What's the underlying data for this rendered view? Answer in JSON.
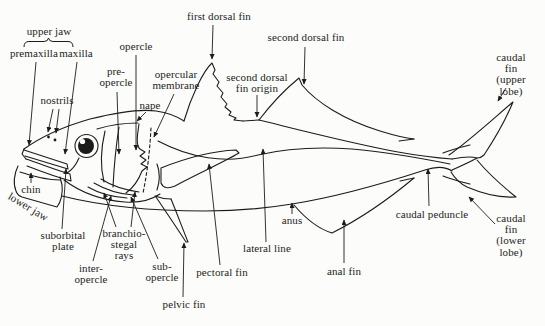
{
  "figure": {
    "type": "fish-anatomy-diagram",
    "ink_color": "#1c1c1c",
    "paper_color": "#fcfcfa",
    "labels": {
      "upper_jaw": "upper jaw",
      "premaxilla": "premaxilla",
      "maxilla": "maxilla",
      "nostrils": "nostrils",
      "opercle": "opercle",
      "pre_opercle": "pre-\nopercle",
      "opercular_membrane": "opercular\nmembrane",
      "nape": "nape",
      "first_dorsal_fin": "first dorsal fin",
      "second_dorsal_fin": "second dorsal fin",
      "second_dorsal_fin_origin": "second dorsal\nfin origin",
      "caudal_fin_upper": "caudal fin\n(upper lobe)",
      "chin": "chin",
      "lower_jaw": "lower jaw",
      "suborbital_plate": "suborbital\nplate",
      "branchiostegal_rays": "branchio-\nstegal\nrays",
      "inter_opercle": "inter-\nopercle",
      "sub_opercle": "sub-\nopercle",
      "pelvic_fin": "pelvic fin",
      "pectoral_fin": "pectoral fin",
      "lateral_line": "lateral line",
      "anus": "anus",
      "anal_fin": "anal fin",
      "caudal_peduncle": "caudal peduncle",
      "caudal_fin_lower": "caudal fin\n(lower lobe)"
    }
  }
}
